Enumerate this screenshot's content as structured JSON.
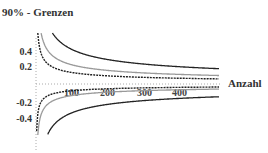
{
  "chart_data": {
    "type": "line",
    "title": "90% - Grenzen",
    "xlabel": "Anzahl",
    "ylabel": "",
    "xlim": [
      0,
      500
    ],
    "ylim": [
      -0.55,
      0.55
    ],
    "x_ticks": [
      "100",
      "200",
      "300",
      "400"
    ],
    "y_ticks": [
      "0.4",
      "0.2",
      "-0.2",
      "-0.4"
    ],
    "grid": false,
    "legend": null,
    "x": [
      5,
      10,
      20,
      30,
      50,
      75,
      100,
      150,
      200,
      300,
      400,
      500
    ],
    "series": [
      {
        "name": "outer upper (solid dark)",
        "style": "solid",
        "color": "#222222",
        "values": [
          null,
          null,
          null,
          0.55,
          0.5,
          0.42,
          0.37,
          0.3,
          0.26,
          0.22,
          0.19,
          0.18
        ]
      },
      {
        "name": "middle upper (solid gray)",
        "style": "solid",
        "color": "#999999",
        "values": [
          0.55,
          0.52,
          0.38,
          0.31,
          0.24,
          0.2,
          0.17,
          0.14,
          0.13,
          0.12,
          0.11,
          0.1
        ]
      },
      {
        "name": "inner upper (dashed)",
        "style": "dashed",
        "color": "#222222",
        "values": [
          0.55,
          0.35,
          0.2,
          0.15,
          0.11,
          0.09,
          0.08,
          0.07,
          0.065,
          0.06,
          0.06,
          0.06
        ]
      },
      {
        "name": "inner lower (dashed)",
        "style": "dashed",
        "color": "#222222",
        "values": [
          -0.55,
          -0.3,
          -0.17,
          -0.12,
          -0.08,
          -0.06,
          -0.05,
          -0.04,
          -0.04,
          -0.035,
          -0.035,
          -0.035
        ]
      },
      {
        "name": "middle lower (solid gray)",
        "style": "solid",
        "color": "#999999",
        "values": [
          -0.55,
          -0.45,
          -0.28,
          -0.2,
          -0.14,
          -0.11,
          -0.1,
          -0.08,
          -0.07,
          -0.065,
          -0.06,
          -0.06
        ]
      },
      {
        "name": "outer lower (solid dark)",
        "style": "solid",
        "color": "#222222",
        "values": [
          null,
          null,
          null,
          -0.55,
          -0.4,
          -0.33,
          -0.28,
          -0.22,
          -0.2,
          -0.17,
          -0.16,
          -0.15
        ]
      }
    ]
  }
}
